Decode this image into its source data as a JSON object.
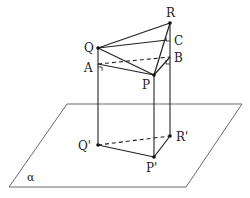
{
  "figure": {
    "type": "3D geometry: triangle PQR projected onto plane alpha",
    "plane": {
      "label": "α",
      "corners": [
        [
          67,
          104
        ],
        [
          242,
          104
        ],
        [
          186,
          187
        ],
        [
          9,
          187
        ]
      ],
      "label_pos": [
        27,
        181
      ]
    },
    "points": {
      "Q": {
        "label": "Q",
        "pos": [
          98,
          48
        ],
        "label_pos": [
          84,
          52
        ]
      },
      "R": {
        "label": "R",
        "pos": [
          170,
          23
        ],
        "label_pos": [
          166,
          16
        ]
      },
      "P": {
        "label": "P",
        "pos": [
          154,
          75
        ],
        "label_pos": [
          142,
          89
        ]
      },
      "A": {
        "label": "A",
        "pos": [
          98,
          64
        ],
        "label_pos": [
          84,
          72
        ]
      },
      "B": {
        "label": "B",
        "pos": [
          170,
          57
        ],
        "label_pos": [
          175,
          62
        ]
      },
      "C": {
        "label": "C",
        "pos": [
          167,
          40
        ],
        "label_pos": [
          174,
          45
        ]
      },
      "Qp": {
        "label": "Q'",
        "pos": [
          98,
          145
        ],
        "label_pos": [
          78,
          150
        ]
      },
      "Rp": {
        "label": "R'",
        "pos": [
          170,
          136
        ],
        "label_pos": [
          176,
          141
        ]
      },
      "Pp": {
        "label": "P'",
        "pos": [
          154,
          157
        ],
        "label_pos": [
          146,
          172
        ]
      }
    },
    "segments_solid": [
      [
        "Q",
        "R"
      ],
      [
        "Q",
        "C"
      ],
      [
        "Q",
        "P"
      ],
      [
        "P",
        "R"
      ],
      [
        "A",
        "P"
      ],
      [
        "P",
        "B"
      ],
      [
        "Q",
        "Qp"
      ],
      [
        "R",
        "Rp"
      ],
      [
        "P",
        "Pp"
      ],
      [
        "Qp",
        "Pp"
      ],
      [
        "Pp",
        "Rp"
      ]
    ],
    "segments_dashed": [
      [
        "A",
        "B"
      ],
      [
        "Qp",
        "Rp"
      ]
    ],
    "right_angle_markers": [
      "A",
      "B",
      "C"
    ]
  }
}
